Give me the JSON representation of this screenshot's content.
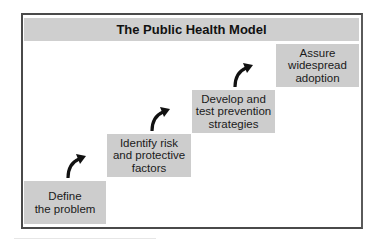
{
  "diagram": {
    "title": "The Public Health Model",
    "steps": [
      {
        "label": "Define\nthe problem"
      },
      {
        "label": "Identify risk\nand protective\nfactors"
      },
      {
        "label": "Develop and\ntest prevention\nstrategies"
      },
      {
        "label": "Assure\nwidespread\nadoption"
      }
    ],
    "arrows": [
      "curved-up-right-arrow",
      "curved-up-right-arrow",
      "curved-up-right-arrow"
    ],
    "colors": {
      "box_fill": "#cdcdcd",
      "title_fill": "#cfcfcf",
      "border": "#4a4a4a",
      "arrow": "#111111"
    }
  }
}
